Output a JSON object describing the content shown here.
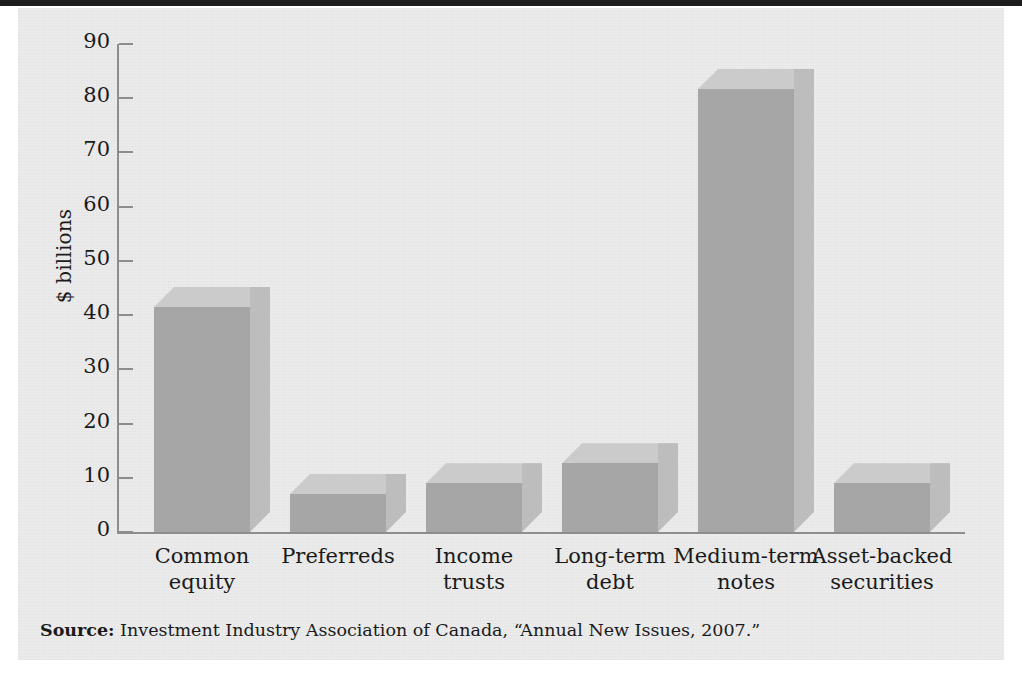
{
  "figure": {
    "background_color": "#ebebeb",
    "top_rule_color": "#1d1d1d"
  },
  "source": {
    "label": "Source:",
    "text": " Investment Industry Association of Canada, “Annual New Issues, 2007.”"
  },
  "axis": {
    "ylabel": "$ billions",
    "ticks": [
      "0",
      "10",
      "20",
      "30",
      "40",
      "50",
      "60",
      "70",
      "80",
      "90"
    ]
  },
  "colors": {
    "bar_front": "#a6a6a6",
    "bar_top": "#cbcbcb",
    "bar_side": "#bdbdbd",
    "axis": "#8d8d8d",
    "text": "#1a1a1a"
  },
  "chart_data": {
    "type": "bar",
    "title": "",
    "subtitle": "",
    "xlabel": "",
    "ylabel": "$ billions",
    "ylim": [
      0,
      90
    ],
    "ytick_interval": 10,
    "yticks": [
      0,
      10,
      20,
      30,
      40,
      50,
      60,
      70,
      80,
      90
    ],
    "grid": false,
    "legend": false,
    "style": "3d-isometric",
    "categories": [
      "Common equity",
      "Preferreds",
      "Income trusts",
      "Long-term debt",
      "Medium-term notes",
      "Asset-backed securities"
    ],
    "category_lines": [
      [
        "Common",
        "equity"
      ],
      [
        "Preferreds",
        ""
      ],
      [
        "Income",
        "trusts"
      ],
      [
        "Long-term",
        "debt"
      ],
      [
        "Medium-term",
        "notes"
      ],
      [
        "Asset-backed",
        "securities"
      ]
    ],
    "values": [
      41.5,
      7,
      9,
      12.7,
      81.7,
      9
    ],
    "units": "billions of dollars"
  }
}
